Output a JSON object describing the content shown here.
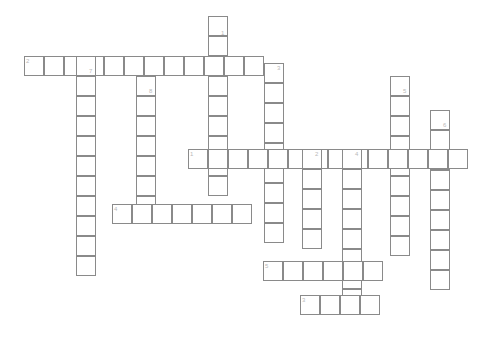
{
  "page": {
    "width": 490,
    "height": 353,
    "background_color": "#ffffff"
  },
  "grid": {
    "cell_size": 20,
    "cell_fill": "#ffffff",
    "cell_border_color": "#8a8a8a",
    "number_color": "#b9b9b9",
    "number_font_size": 6
  },
  "entries": [
    {
      "number": "1",
      "direction": "down",
      "length": 9,
      "start_x": 208,
      "start_y": 16,
      "label_x": 221,
      "label_y": 30
    },
    {
      "number": "2",
      "direction": "across",
      "length": 12,
      "start_x": 24,
      "start_y": 56,
      "label_x": 26,
      "label_y": 58
    },
    {
      "number": "3",
      "direction": "down",
      "length": 9,
      "start_x": 264,
      "start_y": 63,
      "label_x": 277,
      "label_y": 65
    },
    {
      "number": "5",
      "direction": "down",
      "length": 9,
      "start_x": 390,
      "start_y": 76,
      "label_x": 403,
      "label_y": 88
    },
    {
      "number": "7",
      "direction": "down",
      "length": 11,
      "start_x": 76,
      "start_y": 56,
      "label_x": 89,
      "label_y": 68
    },
    {
      "number": "8",
      "direction": "down",
      "length": 7,
      "start_x": 136,
      "start_y": 76,
      "label_x": 149,
      "label_y": 88
    },
    {
      "number": "6",
      "direction": "down",
      "length": 9,
      "start_x": 430,
      "start_y": 110,
      "label_x": 443,
      "label_y": 122
    },
    {
      "number": "1",
      "direction": "across",
      "length": 14,
      "start_x": 188,
      "start_y": 149,
      "label_x": 190,
      "label_y": 151
    },
    {
      "number": "2",
      "direction": "down",
      "length": 5,
      "start_x": 302,
      "start_y": 149,
      "label_x": 315,
      "label_y": 151
    },
    {
      "number": "4",
      "direction": "down",
      "length": 8,
      "start_x": 342,
      "start_y": 149,
      "label_x": 355,
      "label_y": 151
    },
    {
      "number": "4",
      "direction": "across",
      "length": 7,
      "start_x": 112,
      "start_y": 204,
      "label_x": 114,
      "label_y": 206
    },
    {
      "number": "5",
      "direction": "across",
      "length": 6,
      "start_x": 263,
      "start_y": 261,
      "label_x": 265,
      "label_y": 263
    },
    {
      "number": "3",
      "direction": "across",
      "length": 4,
      "start_x": 300,
      "start_y": 295,
      "label_x": 302,
      "label_y": 297
    }
  ]
}
